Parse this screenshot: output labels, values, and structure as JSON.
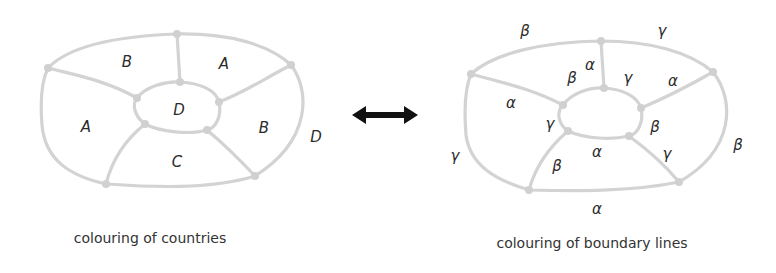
{
  "figure": {
    "left": {
      "caption": "colouring of countries",
      "region_labels": [
        {
          "id": "top-left",
          "text": "B",
          "x": 127,
          "y": 62
        },
        {
          "id": "top-right",
          "text": "A",
          "x": 224,
          "y": 64
        },
        {
          "id": "left",
          "text": "A",
          "x": 86,
          "y": 127
        },
        {
          "id": "center",
          "text": "D",
          "x": 179,
          "y": 110
        },
        {
          "id": "right",
          "text": "B",
          "x": 264,
          "y": 128
        },
        {
          "id": "bottom",
          "text": "C",
          "x": 177,
          "y": 162
        },
        {
          "id": "outside",
          "text": "D",
          "x": 316,
          "y": 137
        }
      ]
    },
    "connector": {
      "icon": "double-headed-arrow"
    },
    "right": {
      "caption": "colouring of boundary lines",
      "edge_labels": [
        {
          "id": "outer-top-left",
          "text": "β",
          "x": 525,
          "y": 31
        },
        {
          "id": "outer-top-right",
          "text": "γ",
          "x": 662,
          "y": 31
        },
        {
          "id": "spoke-top",
          "text": "α",
          "x": 590,
          "y": 65
        },
        {
          "id": "inner-top-left",
          "text": "β",
          "x": 572,
          "y": 78
        },
        {
          "id": "inner-top-right",
          "text": "γ",
          "x": 628,
          "y": 78
        },
        {
          "id": "spoke-upper-right",
          "text": "α",
          "x": 673,
          "y": 81
        },
        {
          "id": "spoke-upper-left",
          "text": "α",
          "x": 511,
          "y": 103
        },
        {
          "id": "inner-left",
          "text": "γ",
          "x": 550,
          "y": 124
        },
        {
          "id": "inner-right",
          "text": "β",
          "x": 655,
          "y": 127
        },
        {
          "id": "outer-right",
          "text": "β",
          "x": 738,
          "y": 145
        },
        {
          "id": "outer-left",
          "text": "γ",
          "x": 455,
          "y": 156
        },
        {
          "id": "inner-bottom",
          "text": "α",
          "x": 597,
          "y": 152
        },
        {
          "id": "spoke-lower-right",
          "text": "γ",
          "x": 667,
          "y": 154
        },
        {
          "id": "spoke-lower-left",
          "text": "β",
          "x": 557,
          "y": 166
        },
        {
          "id": "outer-bottom",
          "text": "α",
          "x": 597,
          "y": 209
        }
      ]
    },
    "colors": {
      "line": "#d3d3d3",
      "node": "#d0d0d0",
      "text": "#2b2b2b",
      "arrow": "#111111"
    }
  }
}
